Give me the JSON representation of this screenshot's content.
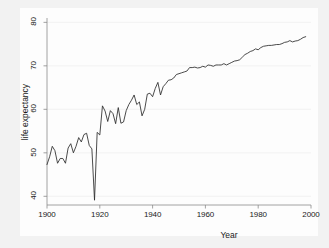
{
  "chart_data": {
    "type": "line",
    "title": "",
    "xlabel": "Year",
    "ylabel": "life expectancy",
    "xlim": [
      1900,
      2000
    ],
    "ylim": [
      38,
      81
    ],
    "grid": true,
    "grid_axis": "y",
    "legend": null,
    "line_color": "#2b2b2b",
    "xticks": [
      1900,
      1920,
      1940,
      1960,
      1980,
      2000
    ],
    "yticks": [
      40,
      50,
      60,
      70,
      80
    ],
    "series": [
      {
        "name": "life expectancy",
        "x": [
          1900,
          1901,
          1902,
          1903,
          1904,
          1905,
          1906,
          1907,
          1908,
          1909,
          1910,
          1911,
          1912,
          1913,
          1914,
          1915,
          1916,
          1917,
          1918,
          1919,
          1920,
          1921,
          1922,
          1923,
          1924,
          1925,
          1926,
          1927,
          1928,
          1929,
          1930,
          1931,
          1932,
          1933,
          1934,
          1935,
          1936,
          1937,
          1938,
          1939,
          1940,
          1941,
          1942,
          1943,
          1944,
          1945,
          1946,
          1947,
          1948,
          1949,
          1950,
          1951,
          1952,
          1953,
          1954,
          1955,
          1956,
          1957,
          1958,
          1959,
          1960,
          1961,
          1962,
          1963,
          1964,
          1965,
          1966,
          1967,
          1968,
          1969,
          1970,
          1971,
          1972,
          1973,
          1974,
          1975,
          1976,
          1977,
          1978,
          1979,
          1980,
          1981,
          1982,
          1983,
          1984,
          1985,
          1986,
          1987,
          1988,
          1989,
          1990,
          1991,
          1992,
          1993,
          1994,
          1995,
          1996,
          1997,
          1998
        ],
        "values": [
          47.3,
          49.1,
          51.5,
          50.5,
          47.6,
          48.7,
          48.7,
          47.6,
          51.1,
          52.1,
          50.0,
          51.5,
          53.5,
          52.5,
          54.2,
          54.5,
          51.7,
          50.9,
          39.1,
          54.7,
          54.1,
          60.8,
          59.6,
          57.2,
          59.7,
          59.0,
          56.7,
          60.4,
          56.8,
          57.1,
          59.7,
          61.1,
          62.1,
          63.3,
          61.1,
          61.7,
          58.5,
          60.0,
          63.5,
          63.7,
          62.9,
          64.8,
          66.2,
          63.3,
          65.2,
          65.9,
          66.7,
          66.8,
          67.2,
          68.0,
          68.2,
          68.4,
          68.6,
          68.8,
          69.6,
          69.6,
          69.7,
          69.5,
          69.6,
          69.9,
          69.7,
          70.2,
          70.1,
          69.9,
          70.2,
          70.2,
          70.2,
          70.5,
          70.2,
          70.5,
          70.8,
          71.1,
          71.2,
          71.4,
          72.0,
          72.6,
          72.9,
          73.3,
          73.5,
          73.9,
          73.7,
          74.2,
          74.5,
          74.6,
          74.7,
          74.7,
          74.8,
          74.9,
          74.9,
          75.1,
          75.4,
          75.5,
          75.8,
          75.5,
          75.7,
          75.8,
          76.1,
          76.5,
          76.7
        ]
      }
    ],
    "annotations": [
      {
        "label": "1918 influenza pandemic trough",
        "x": 1918,
        "y": 39.1
      }
    ]
  },
  "axes": {
    "x_title": "Year",
    "y_title": "life expectancy",
    "x_tick_labels": [
      "1900",
      "1920",
      "1940",
      "1960",
      "1980",
      "2000"
    ],
    "y_tick_labels": [
      "40",
      "50",
      "60",
      "70",
      "80"
    ]
  }
}
